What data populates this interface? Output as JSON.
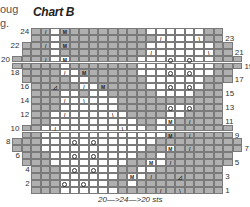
{
  "fragments": [
    "oug",
    "g."
  ],
  "title": "Chart B",
  "footer": "20—>24—>20 sts",
  "colors": {
    "shade": "#b0b0b0",
    "white": "#ffffff",
    "line": "#7a7a7a"
  },
  "row_labels_left": [
    "24",
    "22",
    "20",
    "18",
    "16",
    "14",
    "12",
    "10",
    "8",
    "6",
    "4",
    "2"
  ],
  "row_labels_right": [
    "23",
    "21",
    "19",
    "17",
    "15",
    "13",
    "11",
    "9",
    "7",
    "5",
    "3",
    "1"
  ],
  "row_extents": {
    "1": [
      2,
      21
    ],
    "2": [
      2,
      21
    ],
    "3": [
      2,
      21
    ],
    "4": [
      2,
      21
    ],
    "5": [
      1,
      22
    ],
    "6": [
      1,
      22
    ],
    "7": [
      0,
      23
    ],
    "8": [
      0,
      23
    ],
    "9": [
      1,
      22
    ],
    "10": [
      1,
      22
    ],
    "11": [
      2,
      21
    ],
    "12": [
      2,
      21
    ],
    "13": [
      2,
      21
    ],
    "14": [
      2,
      21
    ],
    "15": [
      2,
      21
    ],
    "16": [
      2,
      21
    ],
    "17": [
      1,
      22
    ],
    "18": [
      1,
      22
    ],
    "19": [
      0,
      23
    ],
    "20": [
      0,
      23
    ],
    "21": [
      1,
      22
    ],
    "22": [
      1,
      22
    ],
    "23": [
      2,
      21
    ],
    "24": [
      2,
      21
    ]
  },
  "white_cells": {
    "24": [
      4,
      14,
      15,
      16,
      17,
      18,
      19
    ],
    "23": [
      4,
      15,
      16,
      17,
      18,
      19
    ],
    "22": [
      4,
      14,
      15,
      16,
      17,
      18,
      19,
      20
    ],
    "21": [
      4,
      14,
      15,
      16,
      17,
      18,
      19,
      20
    ],
    "20": [
      4,
      5,
      13,
      14,
      15,
      16,
      17,
      18,
      19,
      20
    ],
    "19": [
      5,
      13,
      14,
      15,
      16,
      17,
      18,
      19,
      20
    ],
    "18": [
      5,
      6,
      13,
      14,
      15,
      16,
      17,
      18,
      19,
      20
    ],
    "17": [
      6,
      7,
      14,
      15,
      16,
      17,
      18,
      19
    ],
    "16": [
      7,
      8,
      14,
      15,
      16,
      17,
      18,
      19
    ],
    "15": [
      5,
      6,
      8,
      9,
      15,
      16,
      17,
      18
    ],
    "14": [
      5,
      6,
      7,
      8,
      9,
      10
    ],
    "13": [
      5,
      6,
      7,
      8,
      9,
      10,
      16,
      17,
      18
    ],
    "12": [
      4,
      5,
      6,
      7,
      8,
      9,
      10,
      11,
      16,
      17
    ],
    "11": [
      4,
      5,
      6,
      7,
      8,
      9,
      10,
      11,
      12,
      15,
      16
    ],
    "10": [
      3,
      4,
      5,
      6,
      7,
      8,
      9,
      10,
      11,
      12,
      13,
      15,
      16
    ],
    "9": [
      3,
      4,
      5,
      6,
      7,
      8,
      9,
      10,
      11,
      12,
      13,
      14,
      15
    ],
    "8": [
      3,
      4,
      5,
      6,
      7,
      8,
      9,
      10,
      11,
      12,
      13,
      14
    ],
    "7": [
      3,
      4,
      5,
      6,
      7,
      8,
      9,
      10,
      11,
      12,
      13,
      16
    ],
    "6": [
      4,
      5,
      6,
      7,
      8,
      9,
      10,
      11,
      12,
      15
    ],
    "5": [
      4,
      5,
      6,
      7,
      8,
      9,
      10,
      11,
      14,
      15
    ],
    "4": [
      5,
      6,
      7,
      8,
      9,
      10,
      13,
      14
    ],
    "3": [
      5,
      6,
      7,
      8,
      9,
      10,
      12,
      13
    ],
    "2": [
      5,
      6,
      7,
      8,
      9,
      12
    ],
    "1": [
      5,
      6,
      7,
      8,
      9,
      10
    ]
  },
  "symbols": {
    "24": {
      "3": "/",
      "5": "M"
    },
    "23": {
      "15": "/",
      "19": "\\"
    },
    "22": {
      "3": "/",
      "5": "M"
    },
    "21": {
      "14": "/",
      "20": "\\"
    },
    "20": {
      "3": "/",
      "5": "M",
      "16": "o",
      "18": "o"
    },
    "18": {
      "5": "/",
      "7": "M",
      "16": "o",
      "18": "o"
    },
    "16": {
      "4": "◿",
      "7": "/",
      "9": "M",
      "16": "o",
      "18": "o"
    },
    "14": {
      "5": "/",
      "7": "\\"
    },
    "13": {
      "16": "o",
      "18": "o"
    },
    "12": {
      "5": "/",
      "10": "\\"
    },
    "11": {
      "16": "M",
      "18": "/"
    },
    "10": {
      "4": "/",
      "11": "\\"
    },
    "9": {
      "16": "M",
      "18": "/"
    },
    "8": {
      "6": "o",
      "8": "o"
    },
    "7": {
      "16": "M",
      "18": "/"
    },
    "6": {
      "6": "o",
      "8": "o"
    },
    "5": {
      "14": "M",
      "16": "/"
    },
    "4": {
      "6": "o",
      "8": "o"
    },
    "3": {
      "12": "M",
      "14": "/",
      "17": "◿"
    },
    "2": {
      "5": "o",
      "7": "o"
    },
    "1": {
      "15": "/",
      "17": "\\"
    }
  }
}
